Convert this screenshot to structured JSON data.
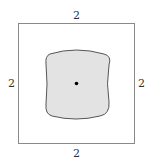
{
  "diagram": {
    "outer_square": {
      "side_labels": {
        "top": "2",
        "bottom": "2",
        "left": "2",
        "right": "2"
      },
      "stroke": "#8a8a8a"
    },
    "inner_region": {
      "fill": "#e3e3e3",
      "stroke": "#555555",
      "shape": "rounded-bulged-square"
    },
    "center_point": {
      "color": "#000000"
    }
  }
}
